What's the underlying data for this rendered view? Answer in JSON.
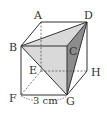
{
  "diagram": {
    "type": "cube",
    "vertices": {
      "A": {
        "label": "A",
        "x": 41,
        "y": 22
      },
      "B": {
        "label": "B",
        "x": 21,
        "y": 46
      },
      "C": {
        "label": "C",
        "x": 67,
        "y": 46
      },
      "D": {
        "label": "D",
        "x": 87,
        "y": 22
      },
      "E": {
        "label": "E",
        "x": 41,
        "y": 71
      },
      "F": {
        "label": "F",
        "x": 21,
        "y": 95
      },
      "G": {
        "label": "G",
        "x": 67,
        "y": 95
      },
      "H": {
        "label": "H",
        "x": 87,
        "y": 71
      }
    },
    "shaded_triangle": [
      "B",
      "D",
      "G"
    ],
    "dimension": {
      "edge": "FG",
      "label": "3 cm"
    },
    "colors": {
      "edge": "#333333",
      "hidden_edge": "#555555",
      "shade_light": "#d9d9d9",
      "shade_dark": "#8c8c8c"
    }
  }
}
